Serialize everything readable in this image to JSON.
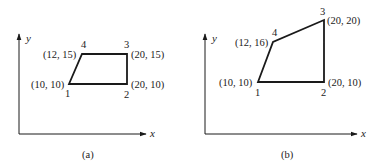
{
  "panels": [
    {
      "caption": "(a)",
      "axis_x_label": "x",
      "axis_y_label": "y",
      "nodes": [
        {
          "id": "1",
          "coord_label": "(10, 10)"
        },
        {
          "id": "2",
          "coord_label": "(20, 10)"
        },
        {
          "id": "3",
          "coord_label": "(20, 15)"
        },
        {
          "id": "4",
          "coord_label": "(12, 15)"
        }
      ]
    },
    {
      "caption": "(b)",
      "axis_x_label": "x",
      "axis_y_label": "y",
      "nodes": [
        {
          "id": "1",
          "coord_label": "(10, 10)"
        },
        {
          "id": "2",
          "coord_label": "(20, 10)"
        },
        {
          "id": "3",
          "coord_label": "(20, 20)"
        },
        {
          "id": "4",
          "coord_label": "(12, 16)"
        }
      ]
    }
  ]
}
